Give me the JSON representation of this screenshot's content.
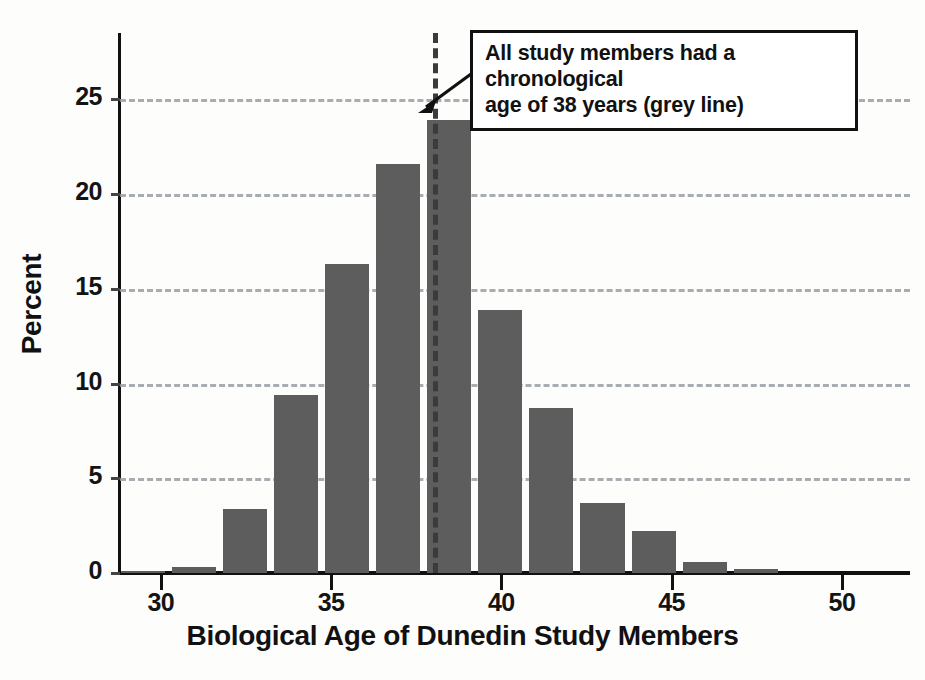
{
  "chart_data": {
    "type": "bar",
    "title": "",
    "subtitle": "",
    "xlabel": "Biological Age of Dunedin Study Members",
    "ylabel": "Percent",
    "xlim": [
      28.8,
      52.0
    ],
    "ylim": [
      0,
      28.5
    ],
    "grid": "horizontal-dashed",
    "legend": "none",
    "bin_width": 1.5,
    "categories": [
      29.5,
      31.0,
      32.5,
      34.0,
      35.5,
      37.0,
      38.5,
      40.0,
      41.5,
      43.0,
      44.5,
      46.0,
      47.5,
      49.0
    ],
    "values": [
      0.1,
      0.3,
      3.4,
      9.4,
      16.3,
      21.6,
      23.9,
      13.9,
      8.7,
      3.7,
      2.2,
      0.6,
      0.2,
      0.0
    ],
    "xticks": [
      30,
      35,
      40,
      45,
      50
    ],
    "yticks": [
      0,
      5,
      10,
      15,
      20,
      25
    ],
    "bar_color": "#5d5d5d",
    "gridline_color": "#9aa0a6",
    "axis_color": "#111111",
    "reference_line": {
      "x": 38,
      "style": "dashed",
      "color": "#3b3b3b",
      "label": "chronological age 38"
    },
    "annotation": {
      "line1": "All study members had a chronological",
      "line2": "age of 38 years (grey line)",
      "points_to": "reference-line-at-38"
    }
  }
}
